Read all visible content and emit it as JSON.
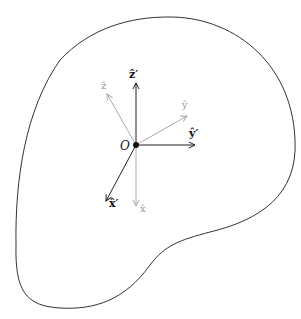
{
  "diagram": {
    "title": "",
    "origin": {
      "label": "O",
      "x": 136,
      "y": 145
    },
    "region": {
      "name": "rigid-body-outline",
      "stroke": "#333333"
    },
    "primed_axes": {
      "color": "#222222",
      "items": [
        {
          "id": "z-prime",
          "label": "ẑ′",
          "to": [
            136,
            83
          ],
          "label_pos": [
            131,
            77
          ]
        },
        {
          "id": "y-prime",
          "label": "ŷ′",
          "to": [
            195,
            145
          ],
          "label_pos": [
            191,
            134
          ]
        },
        {
          "id": "x-prime",
          "label": "x̂′",
          "to": [
            106,
            201
          ],
          "label_pos": [
            111,
            205
          ]
        }
      ]
    },
    "unprimed_axes": {
      "color": "#aaaaaa",
      "items": [
        {
          "id": "z",
          "label": "ẑ",
          "to": [
            107,
            94
          ],
          "label_pos": [
            104,
            87
          ]
        },
        {
          "id": "y",
          "label": "ŷ",
          "to": [
            187,
            116
          ],
          "label_pos": [
            184,
            106
          ]
        },
        {
          "id": "x",
          "label": "x̂",
          "to": [
            136,
            206
          ],
          "label_pos": [
            143,
            211
          ]
        }
      ]
    }
  }
}
